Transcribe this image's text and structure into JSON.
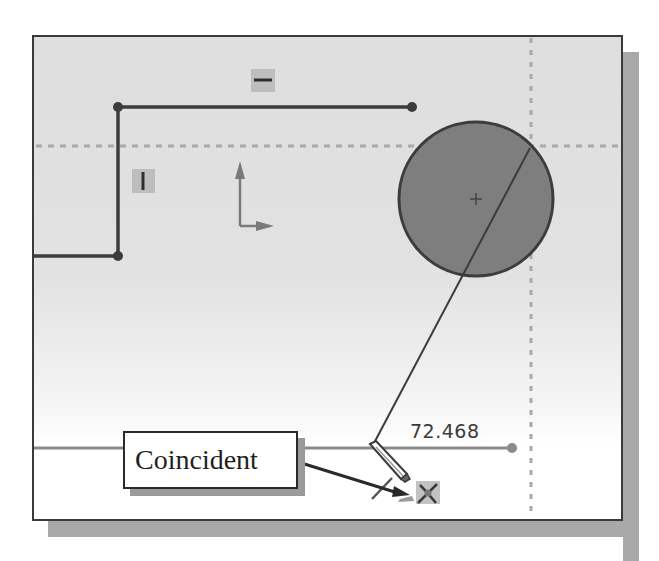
{
  "window": {
    "type": "sketch-viewport",
    "background_gradient": [
      "#dedede",
      "#ffffff"
    ]
  },
  "sketch": {
    "dimension": {
      "value": "72.468"
    },
    "callout": {
      "label": "Coincident"
    },
    "relations": [
      {
        "name": "horizontal-relation-icon",
        "glyph": "horizontal"
      },
      {
        "name": "vertical-relation-icon",
        "glyph": "vertical"
      },
      {
        "name": "coincident-relation-icon",
        "glyph": "coincident"
      }
    ],
    "cursor": {
      "type": "pencil"
    },
    "colors": {
      "line": "#3c3c3c",
      "circle_fill": "#7e7e7e",
      "inference_dotted": "#a9a9a9",
      "construction_line": "#8a8a8a",
      "relation_badge": "#bdbdbd"
    }
  }
}
